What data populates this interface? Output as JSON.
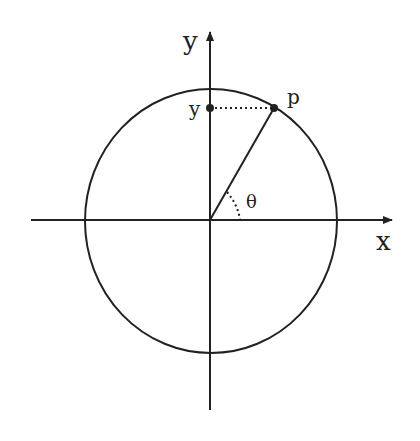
{
  "diagram": {
    "labels": {
      "y_axis": "y",
      "x_axis": "x",
      "y_value": "y",
      "point": "p",
      "angle": "θ"
    },
    "colors": {
      "stroke": "#222222",
      "background": "#ffffff"
    },
    "geometry": {
      "origin": [
        210,
        220
      ],
      "circle_rx": 126,
      "circle_ry": 132,
      "point_p": [
        274,
        108
      ],
      "y_marker": [
        210,
        108
      ]
    }
  }
}
